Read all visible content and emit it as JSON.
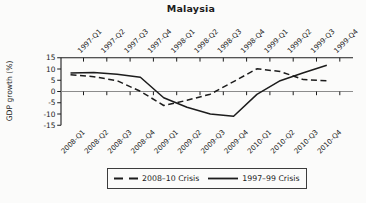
{
  "chart_data": {
    "type": "line",
    "title": "Malaysia",
    "ylabel": "GDP growth (%)",
    "ylim": [
      -15,
      15
    ],
    "yticks": [
      15,
      10,
      5,
      0,
      -5,
      -10,
      -15
    ],
    "top_axis_categories": [
      "1997-Q1",
      "1997-Q2",
      "1997-Q3",
      "1997-Q4",
      "1998-Q1",
      "1998-Q2",
      "1998-Q3",
      "1998-Q4",
      "1999-Q1",
      "1999-Q2",
      "1999-Q3",
      "1999-Q4"
    ],
    "bottom_axis_categories": [
      "2008-Q1",
      "2008-Q2",
      "2008-Q3",
      "2008-Q4",
      "2009-Q1",
      "2009-Q2",
      "2009-Q3",
      "2009-Q4",
      "2010-Q1",
      "2010-Q2",
      "2010-Q3",
      "2010-Q4"
    ],
    "series": [
      {
        "name": "2008–10 Crisis",
        "line_style": "dashed",
        "x_axis": "bottom",
        "values": [
          7.4,
          6.6,
          4.8,
          0.1,
          -6.2,
          -3.9,
          -1.2,
          4.4,
          10.1,
          8.9,
          5.3,
          4.8
        ]
      },
      {
        "name": "1997–99 Crisis",
        "line_style": "solid",
        "x_axis": "top",
        "values": [
          8.2,
          8.5,
          7.7,
          6.3,
          -2.8,
          -7.0,
          -10.0,
          -11.0,
          -1.3,
          4.8,
          8.3,
          11.7
        ]
      }
    ],
    "legend_position": "bottom",
    "grid": false,
    "zero_reference_line": true
  },
  "colors": {
    "line": "#1c1c1c",
    "axis": "#1c1c1c",
    "zero_line": "#8c8c8c",
    "text": "#1c1c1c",
    "background": "#fbfbfa"
  }
}
